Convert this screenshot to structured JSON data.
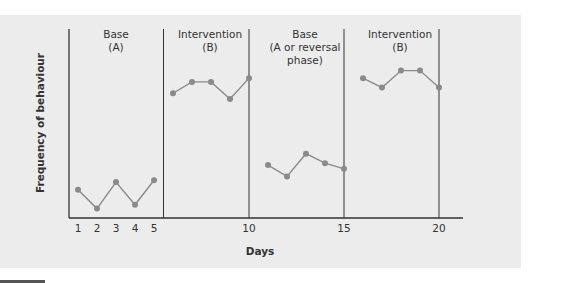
{
  "chart_data": {
    "type": "line",
    "title": "",
    "xlabel": "Days",
    "ylabel": "Frequency of behaviour",
    "xlim": [
      0,
      20.8
    ],
    "ylim": [
      0,
      10
    ],
    "grid": false,
    "legend": null,
    "x_tick_labels": [
      "1",
      "2",
      "3",
      "4",
      "5",
      "10",
      "15",
      "20"
    ],
    "x_ticks": [
      1,
      2,
      3,
      4,
      5,
      10,
      15,
      20
    ],
    "phases": [
      {
        "label_line1": "Base",
        "label_line2": "(A)",
        "label_line3": "",
        "start": 0.5,
        "end": 5.5
      },
      {
        "label_line1": "Intervention",
        "label_line2": "(B)",
        "label_line3": "",
        "start": 5.5,
        "end": 10
      },
      {
        "label_line1": "Base",
        "label_line2": "(A or reversal",
        "label_line3": "phase)",
        "start": 10,
        "end": 15
      },
      {
        "label_line1": "Intervention",
        "label_line2": "(B)",
        "label_line3": "",
        "start": 15,
        "end": 20
      }
    ],
    "phase_dividers": [
      5.5,
      10,
      15,
      20
    ],
    "series": [
      {
        "name": "Base (A)",
        "x": [
          1,
          2,
          3,
          4,
          5
        ],
        "values": [
          1.5,
          0.5,
          1.9,
          0.7,
          2.0
        ]
      },
      {
        "name": "Intervention (B)",
        "x": [
          6,
          7,
          8,
          9,
          10
        ],
        "values": [
          6.6,
          7.2,
          7.2,
          6.3,
          7.4
        ]
      },
      {
        "name": "Base (A or reversal phase)",
        "x": [
          11,
          12,
          13,
          14,
          15
        ],
        "values": [
          2.8,
          2.2,
          3.4,
          2.9,
          2.6
        ]
      },
      {
        "name": "Intervention (B)",
        "x": [
          16,
          17,
          18,
          19,
          20
        ],
        "values": [
          7.4,
          6.9,
          7.8,
          7.8,
          6.9
        ]
      }
    ],
    "colors": {
      "line": "#8a8a8a",
      "marker": "#8a8a8a",
      "axis": "#333333",
      "background": "#ececec"
    }
  }
}
